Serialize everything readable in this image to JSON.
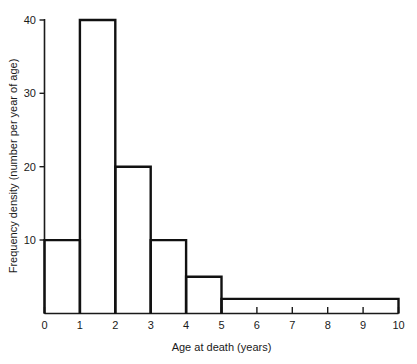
{
  "chart_data": {
    "type": "bar",
    "title": "",
    "subtitle": "",
    "xlabel": "Age at death (years)",
    "ylabel": "Frequency density (number per year of age)",
    "xlim": [
      0,
      10
    ],
    "ylim": [
      0,
      40
    ],
    "grid": false,
    "legend": "none",
    "xticks": [
      "0",
      "1",
      "2",
      "3",
      "4",
      "5",
      "6",
      "7",
      "8",
      "9",
      "10"
    ],
    "xtick_values": [
      0,
      1,
      2,
      3,
      4,
      5,
      6,
      7,
      8,
      9,
      10
    ],
    "yticks": [
      "10",
      "20",
      "30",
      "40"
    ],
    "ytick_values": [
      10,
      20,
      30,
      40
    ],
    "bin_edges": [
      0,
      1,
      2,
      3,
      4,
      5,
      10
    ],
    "categories": [
      "0-1",
      "1-2",
      "2-3",
      "3-4",
      "4-5",
      "5-10"
    ],
    "values": [
      10,
      40,
      20,
      10,
      5,
      2
    ],
    "bars": [
      {
        "label": "0-1",
        "x0": 0,
        "x1": 1,
        "height": 10
      },
      {
        "label": "1-2",
        "x0": 1,
        "x1": 2,
        "height": 40
      },
      {
        "label": "2-3",
        "x0": 2,
        "x1": 3,
        "height": 20
      },
      {
        "label": "3-4",
        "x0": 3,
        "x1": 4,
        "height": 10
      },
      {
        "label": "4-5",
        "x0": 4,
        "x1": 5,
        "height": 5
      },
      {
        "label": "5-10",
        "x0": 5,
        "x1": 10,
        "height": 2
      }
    ],
    "colors": {
      "bar_outline": "#111111",
      "bar_fill": "none",
      "axis": "#1a1a1a",
      "background": "#ffffff",
      "text": "#1a1a1a"
    }
  }
}
